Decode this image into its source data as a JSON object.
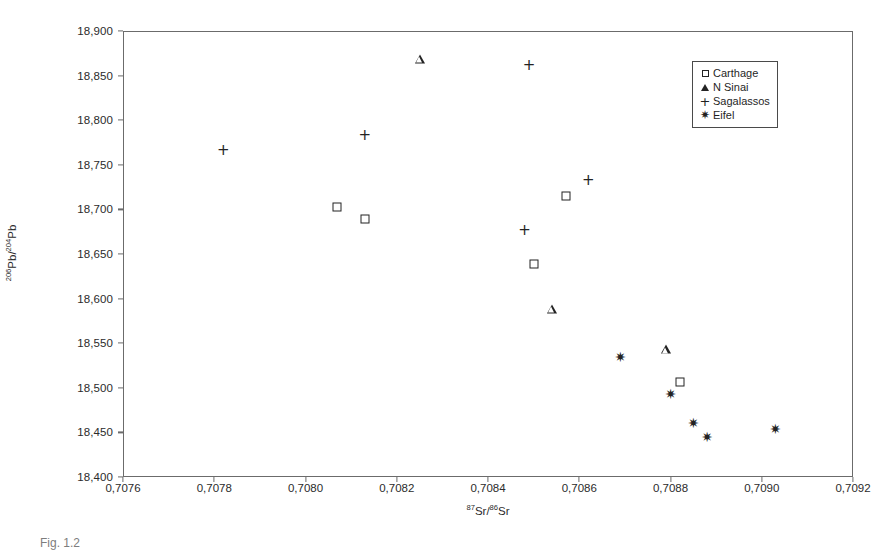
{
  "figure": {
    "caption": "Fig. 1.2"
  },
  "legend": {
    "position": "top-right-inside",
    "entries": [
      {
        "label": "Carthage",
        "marker": "square"
      },
      {
        "label": "N Sinai",
        "marker": "triangle"
      },
      {
        "label": "Sagalassos",
        "marker": "plus"
      },
      {
        "label": "Eifel",
        "marker": "asterisk"
      }
    ]
  },
  "axes": {
    "x": {
      "title_parts": {
        "sup1": "87",
        "mid": "Sr/",
        "sup2": "86",
        "tail": "Sr"
      },
      "title_plain": "87Sr/86Sr",
      "tick_labels": [
        "0,7076",
        "0,7078",
        "0,7080",
        "0,7082",
        "0,7084",
        "0,7086",
        "0,7088",
        "0,7090",
        "0,7092"
      ],
      "tick_values": [
        0.7076,
        0.7078,
        0.708,
        0.7082,
        0.7084,
        0.7086,
        0.7088,
        0.709,
        0.7092
      ],
      "min": 0.7076,
      "max": 0.7092
    },
    "y": {
      "title_parts": {
        "sup1": "206",
        "mid": "Pb/",
        "sup2": "204",
        "tail": "Pb"
      },
      "title_plain": "206Pb/204Pb",
      "tick_labels": [
        "18,900",
        "18,850",
        "18,800",
        "18,750",
        "18,700",
        "18,650",
        "18,600",
        "18,550",
        "18,500",
        "18,450",
        "18,400"
      ],
      "tick_values": [
        18900,
        18850,
        18800,
        18750,
        18700,
        18650,
        18600,
        18550,
        18500,
        18450,
        18400
      ],
      "min": 18400,
      "max": 18900
    }
  },
  "chart_data": {
    "type": "scatter",
    "title": "",
    "xlabel": "87Sr/86Sr",
    "ylabel": "206Pb/204Pb",
    "xlim": [
      0.7076,
      0.7092
    ],
    "ylim": [
      18400,
      18900
    ],
    "grid": false,
    "legend_position": "top-right-inside",
    "decimal_separator": ",",
    "series": [
      {
        "name": "Carthage",
        "marker": "square",
        "points": [
          {
            "x": 0.70807,
            "y": 18703
          },
          {
            "x": 0.70813,
            "y": 18689
          },
          {
            "x": 0.70857,
            "y": 18715
          },
          {
            "x": 0.7085,
            "y": 18639
          },
          {
            "x": 0.70882,
            "y": 18506
          }
        ]
      },
      {
        "name": "N Sinai",
        "marker": "triangle",
        "points": [
          {
            "x": 0.70825,
            "y": 18869
          },
          {
            "x": 0.70854,
            "y": 18588
          },
          {
            "x": 0.70879,
            "y": 18543
          }
        ]
      },
      {
        "name": "Sagalassos",
        "marker": "plus",
        "points": [
          {
            "x": 0.70782,
            "y": 18767
          },
          {
            "x": 0.70813,
            "y": 18783
          },
          {
            "x": 0.70849,
            "y": 18862
          },
          {
            "x": 0.70848,
            "y": 18677
          },
          {
            "x": 0.70862,
            "y": 18733
          }
        ]
      },
      {
        "name": "Eifel",
        "marker": "asterisk",
        "points": [
          {
            "x": 0.70869,
            "y": 18534
          },
          {
            "x": 0.7088,
            "y": 18493
          },
          {
            "x": 0.70885,
            "y": 18460
          },
          {
            "x": 0.70888,
            "y": 18445
          },
          {
            "x": 0.70903,
            "y": 18454
          }
        ]
      }
    ]
  }
}
